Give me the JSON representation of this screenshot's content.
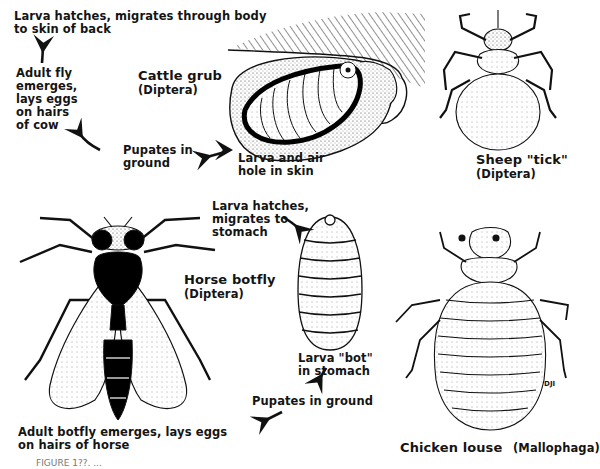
{
  "figure": {
    "caption_partial": "FIGURE 1??. ...",
    "cattle_grub": {
      "title": "Cattle grub",
      "order": "(Diptera)",
      "step_larva_migrates": [
        "Larva hatches, migrates through body",
        "to skin of back"
      ],
      "step_adult": [
        "Adult fly",
        "emerges,",
        "lays eggs",
        "on hairs",
        "of cow"
      ],
      "step_pupates": [
        "Pupates in",
        "ground"
      ],
      "step_larva_skin": [
        "Larva and air",
        "hole in skin"
      ]
    },
    "sheep_tick": {
      "title": "Sheep \"tick\"",
      "order": "(Diptera)"
    },
    "horse_botfly": {
      "title": "Horse botfly",
      "order": "(Diptera)",
      "step_larva_migrates": [
        "Larva hatches,",
        "migrates to",
        "stomach"
      ],
      "step_bot": [
        "Larva \"bot\"",
        "in stomach"
      ],
      "step_pupates": "Pupates in ground",
      "step_adult": [
        "Adult botfly emerges, lays eggs",
        "on hairs of horse"
      ]
    },
    "chicken_louse": {
      "title": "Chicken louse",
      "order": "(Mallophaga)",
      "artist_mark": "DJI"
    }
  }
}
